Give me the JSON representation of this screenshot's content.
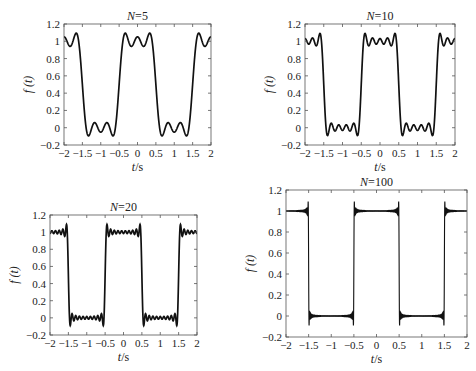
{
  "chart_data": [
    {
      "type": "line",
      "title": "N=5",
      "xlabel": "t/s",
      "ylabel": "f (t)",
      "N": 5,
      "xlim": [
        -2,
        2
      ],
      "ylim": [
        -0.2,
        1.2
      ],
      "xticks": [
        "-2",
        "-1.5",
        "-1",
        "-0.5",
        "0",
        "0.5",
        "1",
        "1.5",
        "2"
      ],
      "yticks": [
        "-0.2",
        "0",
        "0.2",
        "0.4",
        "0.6",
        "0.8",
        "1",
        "1.2"
      ],
      "grid": false,
      "description": "Fourier partial sum (5 terms) of periodic rectangular pulse: 1 for |t|<0.5, 0 for 0.5<|t|<1.5, period 2",
      "box": {
        "x0": 64,
        "y0": 24,
        "x1": 211,
        "y1": 145
      }
    },
    {
      "type": "line",
      "title": "N=10",
      "xlabel": "t/s",
      "ylabel": "f (t)",
      "N": 10,
      "xlim": [
        -2,
        2
      ],
      "ylim": [
        -0.2,
        1.2
      ],
      "xticks": [
        "-2",
        "-1.5",
        "-1",
        "-0.5",
        "0",
        "0.5",
        "1",
        "1.5",
        "2"
      ],
      "yticks": [
        "-0.2",
        "0",
        "0.2",
        "0.4",
        "0.6",
        "0.8",
        "1",
        "1.2"
      ],
      "grid": false,
      "description": "Fourier partial sum (10 terms) of periodic rectangular pulse",
      "box": {
        "x0": 305,
        "y0": 24,
        "x1": 455,
        "y1": 145
      }
    },
    {
      "type": "line",
      "title": "N=20",
      "xlabel": "t/s",
      "ylabel": "f (t)",
      "N": 20,
      "xlim": [
        -2,
        2
      ],
      "ylim": [
        -0.2,
        1.2
      ],
      "xticks": [
        "-2",
        "-1.5",
        "-1",
        "-0.5",
        "0",
        "0.5",
        "1",
        "1.5",
        "2"
      ],
      "yticks": [
        "-0.2",
        "0",
        "0.2",
        "0.4",
        "0.6",
        "0.8",
        "1",
        "1.2"
      ],
      "grid": false,
      "description": "Fourier partial sum (20 terms) of periodic rectangular pulse",
      "box": {
        "x0": 50,
        "y0": 215,
        "x1": 197,
        "y1": 335
      }
    },
    {
      "type": "line",
      "title": "N=100",
      "xlabel": "t/s",
      "ylabel": "f (t)",
      "N": 100,
      "xlim": [
        -2,
        2
      ],
      "ylim": [
        -0.2,
        1.2
      ],
      "xticks": [
        "-2",
        "-1.5",
        "-1",
        "-0.5",
        "0",
        "0.5",
        "1",
        "1.5",
        "2"
      ],
      "yticks": [
        "-0.2",
        "0",
        "0.2",
        "0.4",
        "0.6",
        "0.8",
        "1",
        "1.2"
      ],
      "grid": false,
      "description": "Fourier partial sum (100 terms) of periodic rectangular pulse, showing Gibbs overshoot ~1.09",
      "box": {
        "x0": 286,
        "y0": 190,
        "x1": 467,
        "y1": 337
      }
    }
  ],
  "colors": {
    "line": "#111111",
    "axis": "#555555",
    "background": "#ffffff"
  }
}
